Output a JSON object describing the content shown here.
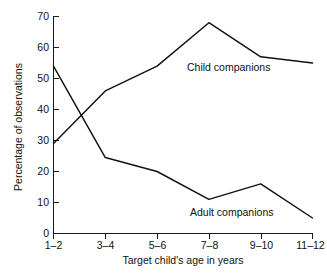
{
  "chart_data": {
    "type": "line",
    "title": "",
    "xlabel": "Target child's age in years",
    "ylabel": "Percentage of observations",
    "categories": [
      "1–2",
      "3–4",
      "5–6",
      "7–8",
      "9–10",
      "11–12"
    ],
    "ylim": [
      0,
      70
    ],
    "yticks": [
      0,
      10,
      20,
      30,
      40,
      50,
      60,
      70
    ],
    "ytick_labels": [
      "0",
      "10",
      "20",
      "30",
      "40",
      "50",
      "60",
      "70"
    ],
    "grid": false,
    "legend_position": "inline-annotations",
    "series": [
      {
        "name": "Child companions",
        "values": [
          29,
          46,
          54,
          68,
          57,
          55
        ],
        "label_text": "Child companions"
      },
      {
        "name": "Adult companions",
        "values": [
          54,
          24.5,
          20,
          11,
          16,
          5
        ],
        "label_text": "Adult companions"
      }
    ],
    "annotations": [
      {
        "text": "Child companions",
        "series": "Child companions"
      },
      {
        "text": "Adult companions",
        "series": "Adult companions"
      }
    ],
    "colors": {
      "line": "#111111",
      "axis": "#1a1a1a",
      "background": "#ffffff"
    }
  },
  "axis": {
    "x_title": "Target child's age in years",
    "y_title": "Percentage of observations"
  }
}
